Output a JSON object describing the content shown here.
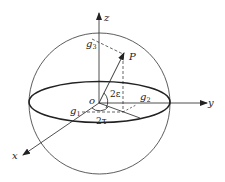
{
  "diagram": {
    "type": "poincare-sphere",
    "axes": {
      "x": "x",
      "y": "y",
      "z": "z"
    },
    "origin_label": "o",
    "point_label": "P",
    "components": {
      "g1": {
        "base": "g",
        "sub": "1"
      },
      "g2": {
        "base": "g",
        "sub": "2"
      },
      "g3": {
        "base": "g",
        "sub": "3"
      }
    },
    "angles": {
      "elevation": "2ε",
      "azimuth": "2τ"
    }
  },
  "colors": {
    "stroke": "#222222",
    "background": "#ffffff"
  }
}
